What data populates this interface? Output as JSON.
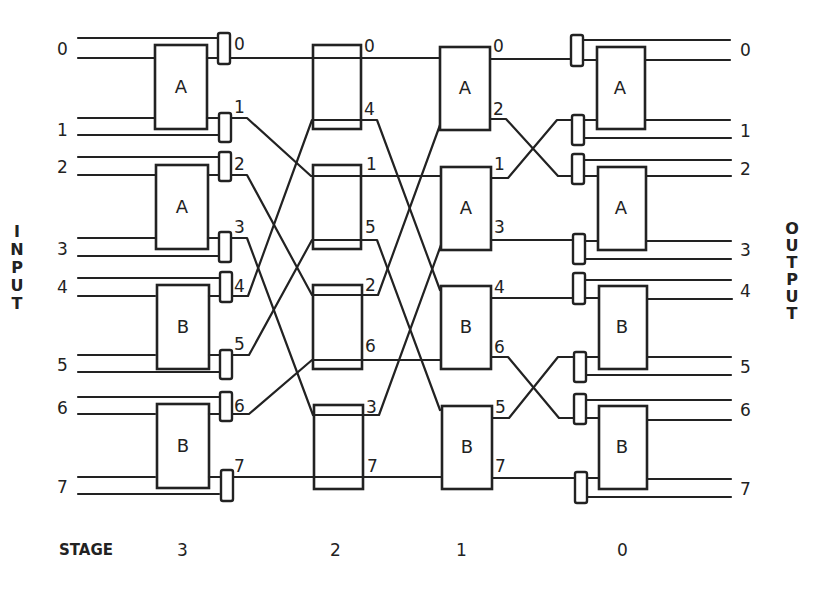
{
  "labels": {
    "input": "INPUT",
    "output": "OUTPUT",
    "stage_word": "STAGE"
  },
  "input_ports": [
    "0",
    "1",
    "2",
    "3",
    "4",
    "5",
    "6",
    "7"
  ],
  "output_ports": [
    "0",
    "1",
    "2",
    "3",
    "4",
    "5",
    "6",
    "7"
  ],
  "stages": [
    "3",
    "2",
    "1",
    "0"
  ],
  "stage3": {
    "blocks": [
      "A",
      "A",
      "B",
      "B"
    ],
    "mux_labels": [
      "0",
      "1",
      "2",
      "3",
      "4",
      "5",
      "6",
      "7"
    ]
  },
  "stage2": {
    "blocks": [
      "",
      "",
      "",
      ""
    ],
    "out_labels": [
      "0",
      "4",
      "1",
      "5",
      "2",
      "6",
      "3",
      "7"
    ]
  },
  "stage1": {
    "blocks": [
      "A",
      "A",
      "B",
      "B"
    ],
    "out_labels": [
      "0",
      "2",
      "1",
      "3",
      "4",
      "6",
      "5",
      "7"
    ]
  },
  "stage0": {
    "blocks": [
      "A",
      "A",
      "B",
      "B"
    ]
  }
}
